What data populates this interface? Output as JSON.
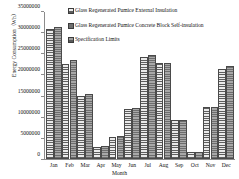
{
  "chart_data": {
    "type": "bar",
    "title": "",
    "xlabel": "Month",
    "ylabel": "Energy Consumption（Wh）",
    "ylim": [
      0,
      35000000
    ],
    "ytick_step": 5000000,
    "yticks": [
      0,
      5000000,
      10000000,
      15000000,
      20000000,
      25000000,
      30000000,
      35000000
    ],
    "ytick_labels": [
      "0",
      "5000000",
      "10000000",
      "15000000",
      "20000000",
      "25000000",
      "30000000",
      "35000000"
    ],
    "grid": false,
    "legend_position": "top-center-inside",
    "categories": [
      "Jan",
      "Feb",
      "Mar",
      "Apr",
      "May",
      "Jun",
      "Jul",
      "Aug",
      "Sep",
      "Oct",
      "Nov",
      "Dec"
    ],
    "series": [
      {
        "name": "Glass Regenerated Pumice External Insulation",
        "values": [
          30400000,
          22200000,
          14500000,
          2400000,
          4700000,
          11400000,
          23800000,
          22300000,
          8700000,
          1100000,
          11800000,
          20900000
        ]
      },
      {
        "name": "Glass Regenerated Pumice Concrete Block Self-insulation",
        "values": [
          30900000,
          23000000,
          15000000,
          2600000,
          4900000,
          11600000,
          24200000,
          22500000,
          8800000,
          1300000,
          12000000,
          21700000
        ]
      },
      {
        "name": "Specification Limits",
        "values": [
          null,
          null,
          null,
          null,
          null,
          null,
          null,
          null,
          null,
          null,
          null,
          null
        ]
      }
    ]
  },
  "legend": {
    "items": [
      {
        "label": "Glass Regenerated Pumice External Insulation",
        "swatch": "hatch-light-swatch"
      },
      {
        "label": "Glass Regenerated Pumice Concrete Block Self-insulation",
        "swatch": "solid-dark-swatch"
      },
      {
        "label": "Specification Limits",
        "swatch": "hatch-mid-swatch"
      }
    ]
  }
}
